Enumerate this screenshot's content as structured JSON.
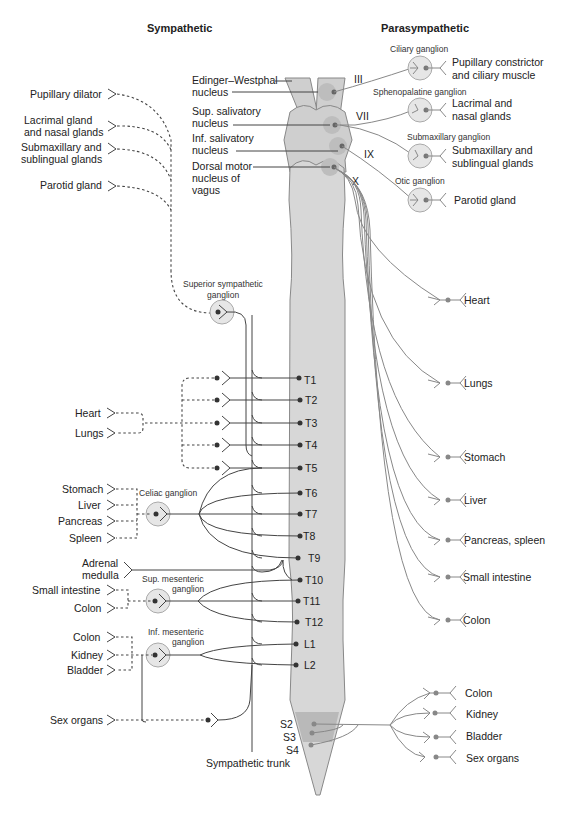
{
  "headers": {
    "sympathetic": "Sympathetic",
    "parasympathetic": "Parasympathetic"
  },
  "brainstem_nuclei": [
    {
      "line1": "Edinger–Westphal",
      "line2": "nucleus"
    },
    {
      "line1": "Sup. salivatory",
      "line2": "nucleus"
    },
    {
      "line1": "Inf. salivatory",
      "line2": "nucleus"
    },
    {
      "line1": "Dorsal motor",
      "line2": "nucleus of",
      "line3": "vagus"
    }
  ],
  "cranial_nerves": [
    "III",
    "VII",
    "IX",
    "X"
  ],
  "parasympathetic_cranial": [
    {
      "ganglion": "Ciliary ganglion",
      "target_line1": "Pupillary constrictor",
      "target_line2": "and ciliary muscle"
    },
    {
      "ganglion": "Sphenopalatine ganglion",
      "target_line1": "Lacrimal and",
      "target_line2": "nasal glands"
    },
    {
      "ganglion": "Submaxillary ganglion",
      "target_line1": "Submaxillary and",
      "target_line2": "sublingual glands"
    },
    {
      "ganglion": "Otic ganglion",
      "target_line1": "Parotid gland",
      "target_line2": ""
    }
  ],
  "parasympathetic_vagal_targets": [
    "Heart",
    "Lungs",
    "Stomach",
    "Liver",
    "Pancreas, spleen",
    "Small intestine",
    "Colon"
  ],
  "parasympathetic_sacral_targets": [
    "Colon",
    "Kidney",
    "Bladder",
    "Sex organs"
  ],
  "sympathetic_head_targets": [
    {
      "line1": "Pupillary dilator",
      "line2": ""
    },
    {
      "line1": "Lacrimal gland",
      "line2": "and nasal glands"
    },
    {
      "line1": "Submaxillary and",
      "line2": "sublingual glands"
    },
    {
      "line1": "Parotid gland",
      "line2": ""
    }
  ],
  "sympathetic_ganglia": {
    "superior": {
      "line1": "Superior sympathetic",
      "line2": "ganglion"
    },
    "celiac": "Celiac ganglion",
    "sup_mesenteric": {
      "line1": "Sup. mesenteric",
      "line2": "ganglion"
    },
    "inf_mesenteric": {
      "line1": "Inf. mesenteric",
      "line2": "ganglion"
    }
  },
  "sympathetic_targets": {
    "thoracic": [
      "Heart",
      "Lungs"
    ],
    "celiac": [
      "Stomach",
      "Liver",
      "Pancreas",
      "Spleen"
    ],
    "adrenal": {
      "line1": "Adrenal",
      "line2": "medulla"
    },
    "sup_mesenteric": [
      "Small intestine",
      "Colon"
    ],
    "inf_mesenteric": [
      "Colon",
      "Kidney",
      "Bladder"
    ],
    "sex": "Sex organs"
  },
  "spinal_segments": [
    "T1",
    "T2",
    "T3",
    "T4",
    "T5",
    "T6",
    "T7",
    "T8",
    "T9",
    "T10",
    "T11",
    "T12",
    "L1",
    "L2"
  ],
  "sacral_segments": [
    "S2",
    "S3",
    "S4"
  ],
  "sympathetic_trunk_label": "Sympathetic trunk"
}
